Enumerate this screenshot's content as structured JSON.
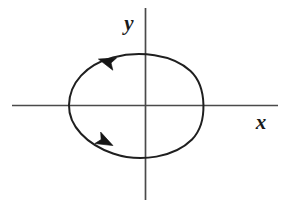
{
  "figure": {
    "background_color": "#ffffff",
    "stroke_color": "#1f1f1f",
    "axis_color": "#4a4a4a",
    "width": 295,
    "height": 208
  },
  "axes": {
    "origin": {
      "x": 145,
      "y": 105
    },
    "x_axis": {
      "label": "x",
      "label_position": {
        "x": 261,
        "y": 129
      },
      "start": {
        "x": 12,
        "y": 105
      },
      "end": {
        "x": 278,
        "y": 105
      }
    },
    "y_axis": {
      "label": "y",
      "label_position": {
        "x": 129,
        "y": 30
      },
      "start": {
        "x": 145,
        "y": 8
      },
      "end": {
        "x": 145,
        "y": 200
      }
    }
  },
  "curve": {
    "name": "closed-oriented-curve",
    "shape": "egg-shaped closed loop, pointed at left end, rounded at right",
    "orientation": "counterclockwise",
    "extrema": {
      "leftmost": {
        "x": 69,
        "y": 105
      },
      "rightmost": {
        "x": 203,
        "y": 105
      },
      "topmost": {
        "x": 152,
        "y": 53
      },
      "bottommost": {
        "x": 150,
        "y": 158
      }
    },
    "path": "M 69 105 C 69 82 88 63 116 57 C 143 51 175 55 192 72 C 207 87 207 124 191 140 C 173 157 140 162 113 153 C 87 144 69 126 69 105 Z"
  },
  "arrows": [
    {
      "name": "upper-direction-arrow",
      "position": {
        "x": 108,
        "y": 62
      },
      "direction": "left-down-left",
      "angle_deg": 197,
      "description": "orientation arrow on upper-left branch of the curve pointing toward negative x"
    },
    {
      "name": "lower-direction-arrow",
      "position": {
        "x": 104,
        "y": 141
      },
      "direction": "right-down-right",
      "angle_deg": 27,
      "description": "orientation arrow on lower-left branch of the curve pointing toward positive x"
    }
  ]
}
